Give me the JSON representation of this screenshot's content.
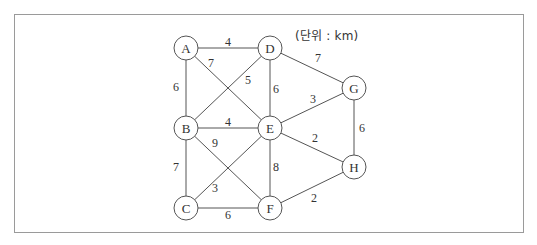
{
  "diagram": {
    "type": "weighted-undirected-graph",
    "unit_label": "(단위 : km)",
    "colors": {
      "frame_border": "#9a9a9a",
      "edge": "#555555",
      "text": "#333333",
      "background": "#ffffff"
    },
    "nodes": [
      {
        "id": "A",
        "label": "A",
        "x": 186,
        "y": 48
      },
      {
        "id": "D",
        "label": "D",
        "x": 270,
        "y": 48
      },
      {
        "id": "G",
        "label": "G",
        "x": 354,
        "y": 88
      },
      {
        "id": "B",
        "label": "B",
        "x": 186,
        "y": 128
      },
      {
        "id": "E",
        "label": "E",
        "x": 270,
        "y": 128
      },
      {
        "id": "H",
        "label": "H",
        "x": 354,
        "y": 167
      },
      {
        "id": "C",
        "label": "C",
        "x": 186,
        "y": 208
      },
      {
        "id": "F",
        "label": "F",
        "x": 270,
        "y": 208
      }
    ],
    "edges": [
      {
        "from": "A",
        "to": "D",
        "weight": "4",
        "lx": 228,
        "ly": 42
      },
      {
        "from": "A",
        "to": "B",
        "weight": "6",
        "lx": 176,
        "ly": 87
      },
      {
        "from": "A",
        "to": "E",
        "weight": "7",
        "lx": 211,
        "ly": 63
      },
      {
        "from": "D",
        "to": "B",
        "weight": "5",
        "lx": 248,
        "ly": 80
      },
      {
        "from": "D",
        "to": "E",
        "weight": "6",
        "lx": 276,
        "ly": 89
      },
      {
        "from": "D",
        "to": "G",
        "weight": "7",
        "lx": 318,
        "ly": 58
      },
      {
        "from": "G",
        "to": "E",
        "weight": "3",
        "lx": 313,
        "ly": 99
      },
      {
        "from": "G",
        "to": "H",
        "weight": "6",
        "lx": 362,
        "ly": 128
      },
      {
        "from": "B",
        "to": "E",
        "weight": "4",
        "lx": 228,
        "ly": 122
      },
      {
        "from": "B",
        "to": "F",
        "weight": "9",
        "lx": 215,
        "ly": 143
      },
      {
        "from": "B",
        "to": "C",
        "weight": "7",
        "lx": 176,
        "ly": 167
      },
      {
        "from": "E",
        "to": "H",
        "weight": "2",
        "lx": 315,
        "ly": 138
      },
      {
        "from": "E",
        "to": "F",
        "weight": "8",
        "lx": 276,
        "ly": 167
      },
      {
        "from": "E",
        "to": "C",
        "weight": "3",
        "lx": 215,
        "ly": 188
      },
      {
        "from": "C",
        "to": "F",
        "weight": "6",
        "lx": 228,
        "ly": 215
      },
      {
        "from": "F",
        "to": "H",
        "weight": "2",
        "lx": 314,
        "ly": 198
      }
    ]
  }
}
